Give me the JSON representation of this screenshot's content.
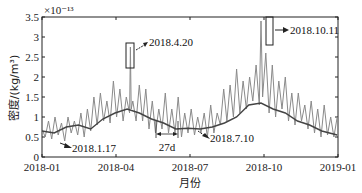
{
  "chart_data": {
    "type": "line",
    "title": "",
    "xlabel": "月份",
    "ylabel": "密度/(kg/m³)",
    "y_multiplier": "×10⁻¹³",
    "ylim": [
      0,
      3.5
    ],
    "yticks": [
      "0",
      "0.5",
      "1",
      "1.5",
      "2",
      "2.5",
      "3",
      "3.5"
    ],
    "xticks": [
      "2018-01",
      "2018-04",
      "2018-07",
      "2018-10",
      "2019-01"
    ],
    "grid": false,
    "legend": "none",
    "series": [
      {
        "name": "daily density",
        "color": "#8a8a8a",
        "x_day": [
          0,
          4,
          8,
          12,
          16,
          20,
          24,
          28,
          32,
          36,
          40,
          44,
          48,
          52,
          56,
          60,
          64,
          68,
          72,
          76,
          80,
          84,
          88,
          92,
          96,
          100,
          104,
          108,
          109,
          110,
          112,
          116,
          120,
          124,
          128,
          132,
          136,
          140,
          144,
          148,
          152,
          156,
          160,
          164,
          168,
          172,
          176,
          180,
          184,
          188,
          192,
          196,
          200,
          204,
          208,
          212,
          216,
          220,
          224,
          228,
          232,
          236,
          240,
          244,
          248,
          252,
          256,
          260,
          264,
          268,
          270,
          272,
          276,
          280,
          284,
          288,
          292,
          296,
          300,
          304,
          308,
          312,
          316,
          320,
          324,
          328,
          332,
          336,
          340,
          344,
          348,
          352,
          356,
          360,
          364
        ],
        "values": [
          0.7,
          0.5,
          0.9,
          0.45,
          1.0,
          0.55,
          0.85,
          0.4,
          1.0,
          0.6,
          0.9,
          0.55,
          1.1,
          0.5,
          1.2,
          0.65,
          1.5,
          0.8,
          1.6,
          0.9,
          1.4,
          0.85,
          1.9,
          1.0,
          1.7,
          0.9,
          1.5,
          1.1,
          2.75,
          1.2,
          1.4,
          0.9,
          1.8,
          0.9,
          1.7,
          0.7,
          1.4,
          0.6,
          1.2,
          0.7,
          1.6,
          0.6,
          1.2,
          0.6,
          1.5,
          0.5,
          1.1,
          0.6,
          1.2,
          0.55,
          1.0,
          0.6,
          1.1,
          0.5,
          1.3,
          0.6,
          1.1,
          0.8,
          1.7,
          0.9,
          1.8,
          1.0,
          2.2,
          1.1,
          1.9,
          1.2,
          2.0,
          1.4,
          2.3,
          1.3,
          3.4,
          1.5,
          2.6,
          1.1,
          2.3,
          1.0,
          1.9,
          1.2,
          2.0,
          0.9,
          1.6,
          0.8,
          1.6,
          0.9,
          1.3,
          0.7,
          1.4,
          0.6,
          1.2,
          0.5,
          1.3,
          0.55,
          1.0,
          0.5,
          1.0
        ]
      },
      {
        "name": "27-day moving average",
        "color": "#444444",
        "x_day": [
          0,
          15,
          30,
          45,
          60,
          75,
          90,
          105,
          120,
          135,
          150,
          165,
          180,
          195,
          210,
          225,
          240,
          255,
          270,
          285,
          300,
          315,
          330,
          345,
          364
        ],
        "values": [
          0.65,
          0.6,
          0.75,
          0.8,
          0.7,
          0.95,
          1.1,
          1.2,
          1.1,
          0.95,
          0.85,
          0.7,
          0.72,
          0.7,
          0.75,
          0.85,
          1.0,
          1.3,
          1.35,
          1.2,
          1.1,
          0.9,
          0.8,
          0.65,
          0.55
        ]
      }
    ],
    "annotations": [
      {
        "text": "2018.4.20",
        "day": 109,
        "value": 2.75,
        "box": true
      },
      {
        "text": "2018.10.11",
        "day": 283,
        "value": 3.4,
        "box": true
      },
      {
        "text": "2018.1.17",
        "day": 16,
        "value": 0.5
      },
      {
        "text": "2018.7.10",
        "day": 190,
        "value": 0.6
      },
      {
        "text": "27d",
        "span_days": [
          124,
          151
        ]
      }
    ]
  }
}
